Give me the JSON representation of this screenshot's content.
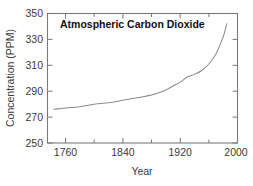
{
  "chart_data": {
    "type": "line",
    "title": "Atmospheric Carbon Dioxide",
    "xlabel": "Year",
    "ylabel": "Concentration (PPM)",
    "xlim": [
      1735,
      2000
    ],
    "ylim": [
      250,
      350
    ],
    "grid": false,
    "legend": "none",
    "line_color": "#8c8c8c",
    "frame_color": "#7a7a7a",
    "background_color": "#ffffff",
    "x_major_ticks": [
      1760,
      1840,
      1920,
      2000
    ],
    "x_major_tick_labels": [
      "1760",
      "1840",
      "1920",
      "2000"
    ],
    "x_minor_ticks": [
      1800,
      1880,
      1960
    ],
    "y_major_ticks": [
      250,
      270,
      290,
      310,
      330,
      350
    ],
    "y_major_tick_labels": [
      "250",
      "270",
      "290",
      "310",
      "330",
      "350"
    ],
    "series": [
      {
        "name": "Atmospheric CO2",
        "x": [
          1744,
          1760,
          1780,
          1800,
          1820,
          1840,
          1860,
          1880,
          1900,
          1910,
          1920,
          1930,
          1940,
          1950,
          1960,
          1970,
          1980,
          1985
        ],
        "values": [
          276,
          277,
          278,
          280,
          281,
          283,
          285,
          287,
          291,
          294,
          297,
          301,
          303,
          306,
          311,
          319,
          332,
          342
        ]
      }
    ]
  }
}
